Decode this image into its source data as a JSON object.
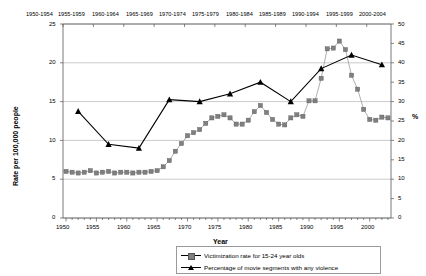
{
  "chart_data": {
    "type": "line",
    "title": "",
    "xlabel": "Year",
    "ylabel": "Rate per 100,000 people",
    "y2label": "%",
    "xlim": [
      1949.5,
      2003.5
    ],
    "ylim": [
      0,
      25
    ],
    "y2lim": [
      0,
      50
    ],
    "grid": true,
    "legend_position": "bottom-right",
    "y_ticks": [
      0,
      5,
      10,
      15,
      20,
      25
    ],
    "y2_ticks": [
      0,
      5,
      10,
      15,
      20,
      25,
      30,
      35,
      40,
      45,
      50
    ],
    "x_ticks": [
      1950,
      1955,
      1960,
      1965,
      1970,
      1975,
      1980,
      1985,
      1990,
      1995,
      2000
    ],
    "top_axis_labels": [
      "1950-1954",
      "1955-1959",
      "1960-1964",
      "1965-1969",
      "1970-1974",
      "1975-1979",
      "1980-1984",
      "1985-1989",
      "1990-1994",
      "1995-1999",
      "2000-2004"
    ],
    "series": [
      {
        "name": "Victimization rate for 15-24 year olds",
        "axis": "left",
        "marker": "square",
        "color": "#7f7f7f",
        "x": [
          1950,
          1951,
          1952,
          1953,
          1954,
          1955,
          1956,
          1957,
          1958,
          1959,
          1960,
          1961,
          1962,
          1963,
          1964,
          1965,
          1966,
          1967,
          1968,
          1969,
          1970,
          1971,
          1972,
          1973,
          1974,
          1975,
          1976,
          1977,
          1978,
          1979,
          1980,
          1981,
          1982,
          1983,
          1984,
          1985,
          1986,
          1987,
          1988,
          1989,
          1990,
          1991,
          1992,
          1993,
          1994,
          1995,
          1996,
          1997,
          1998,
          1999,
          2000,
          2001,
          2002,
          2003
        ],
        "values": [
          6.0,
          5.9,
          5.8,
          5.9,
          6.1,
          5.8,
          5.9,
          6.0,
          5.8,
          5.9,
          5.9,
          5.8,
          5.9,
          5.9,
          6.0,
          6.1,
          6.6,
          7.4,
          8.6,
          9.6,
          10.6,
          11.0,
          11.4,
          12.2,
          12.9,
          13.1,
          13.3,
          12.9,
          12.1,
          12.1,
          12.6,
          13.7,
          14.5,
          13.6,
          12.7,
          12.1,
          12.0,
          12.9,
          13.3,
          13.1,
          15.1,
          15.1,
          18.0,
          21.8,
          21.9,
          22.8,
          21.7,
          18.4,
          16.6,
          14.0,
          12.7,
          12.6,
          13.0,
          12.9
        ]
      },
      {
        "name": "Percentage of movie segments with any violence",
        "axis": "right",
        "marker": "triangle",
        "color": "#000000",
        "x": [
          1952,
          1957,
          1962,
          1967,
          1972,
          1977,
          1982,
          1987,
          1992,
          1997,
          2002
        ],
        "values": [
          27.5,
          19.0,
          18.0,
          30.5,
          30.0,
          32.0,
          35.0,
          30.0,
          38.5,
          42.0,
          39.5
        ]
      }
    ]
  }
}
